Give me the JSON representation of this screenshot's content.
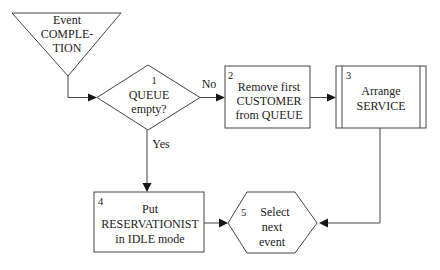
{
  "diagram": {
    "nodes": {
      "event_completion": {
        "lines": [
          "Event",
          "COMPLE-",
          "TION"
        ]
      },
      "queue_empty": {
        "number": "1",
        "lines": [
          "QUEUE",
          "empty?"
        ]
      },
      "remove_customer": {
        "number": "2",
        "lines": [
          "Remove first",
          "CUSTOMER",
          "from QUEUE"
        ]
      },
      "arrange_service": {
        "number": "3",
        "lines": [
          "Arrange",
          "SERVICE"
        ]
      },
      "put_reservationist": {
        "number": "4",
        "lines": [
          "Put",
          "RESERVATIONIST",
          "in IDLE mode"
        ]
      },
      "select_next_event": {
        "number": "5",
        "lines": [
          "Select",
          "next",
          "event"
        ]
      }
    },
    "edge_labels": {
      "no": "No",
      "yes": "Yes"
    },
    "colors": {
      "background": "#ffffff",
      "line": "#454545",
      "arrowhead": "#161616",
      "text": "#222222"
    }
  }
}
